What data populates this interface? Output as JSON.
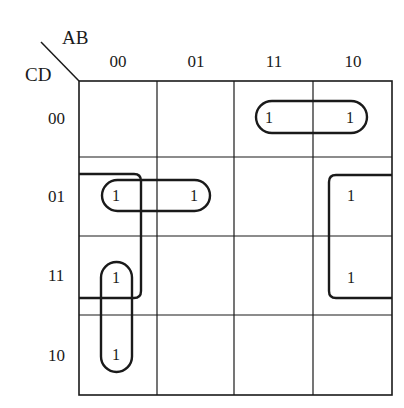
{
  "kmap": {
    "row_var": "CD",
    "col_var": "AB",
    "col_headers": [
      "00",
      "01",
      "11",
      "10"
    ],
    "row_headers": [
      "00",
      "01",
      "11",
      "10"
    ],
    "cells": [
      [
        "",
        "",
        "1",
        "1"
      ],
      [
        "1",
        "1",
        "",
        "1"
      ],
      [
        "1",
        "",
        "",
        "1"
      ],
      [
        "1",
        "",
        "",
        ""
      ]
    ],
    "groups": [
      {
        "name": "row00-cols11-10",
        "cells": [
          [
            0,
            2
          ],
          [
            0,
            3
          ]
        ]
      },
      {
        "name": "row01-cols00-01",
        "cells": [
          [
            1,
            0
          ],
          [
            1,
            1
          ]
        ]
      },
      {
        "name": "col00-rows11-10",
        "cells": [
          [
            2,
            0
          ],
          [
            3,
            0
          ]
        ]
      },
      {
        "name": "wrap-col00-col10-rows01-11",
        "cells": [
          [
            1,
            0
          ],
          [
            2,
            0
          ],
          [
            1,
            3
          ],
          [
            2,
            3
          ]
        ]
      }
    ],
    "line_color": "#1a1a1a"
  }
}
